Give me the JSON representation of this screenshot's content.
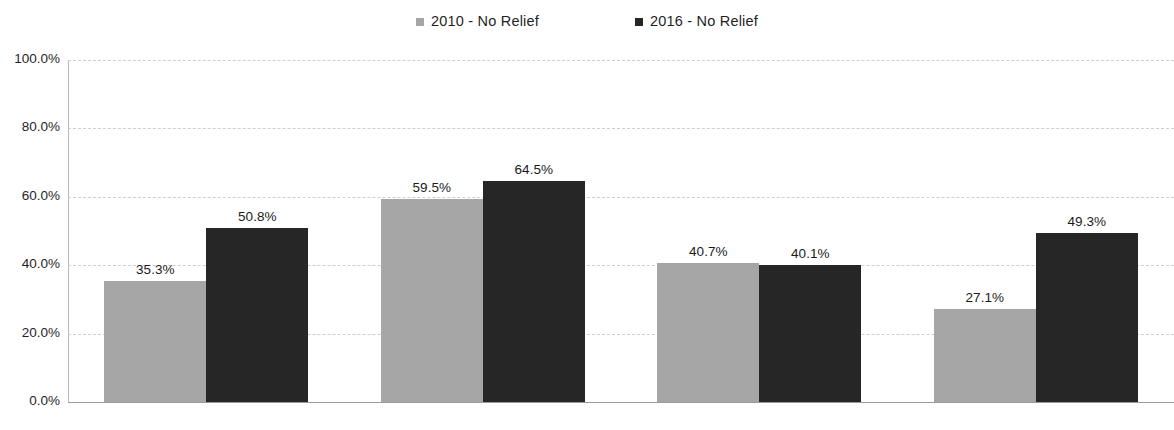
{
  "chart_data": {
    "type": "bar",
    "title": "",
    "subtitle": "",
    "xlabel": "",
    "ylabel": "",
    "categories": [
      "White",
      "Black",
      "Hispanic",
      "Other"
    ],
    "series": [
      {
        "name": "2010 - No Relief",
        "color": "#a6a6a6",
        "values": [
          35.3,
          59.5,
          40.7,
          27.1
        ],
        "labels": [
          "35.3%",
          "59.5%",
          "40.7%",
          "27.1%"
        ]
      },
      {
        "name": "2016 - No Relief",
        "color": "#262626",
        "values": [
          50.8,
          64.5,
          40.1,
          49.3
        ],
        "labels": [
          "50.8%",
          "64.5%",
          "40.1%",
          "49.3%"
        ]
      }
    ],
    "ylim": [
      0,
      100
    ],
    "yticks": [
      0,
      20,
      40,
      60,
      80,
      100
    ],
    "ytick_labels": [
      "0.0%",
      "20.0%",
      "40.0%",
      "60.0%",
      "80.0%",
      "100.0%"
    ],
    "grid": true,
    "grid_axis": "y",
    "grid_style": "dashed",
    "legend_position": "top-center",
    "value_labels": true,
    "background": "#ffffff"
  },
  "legend": {
    "entries": [
      {
        "label": "2010 - No Relief",
        "swatch": "legend-swatch-2010",
        "color": "#a6a6a6"
      },
      {
        "label": "2016 - No Relief",
        "swatch": "legend-swatch-2016",
        "color": "#262626"
      }
    ]
  }
}
